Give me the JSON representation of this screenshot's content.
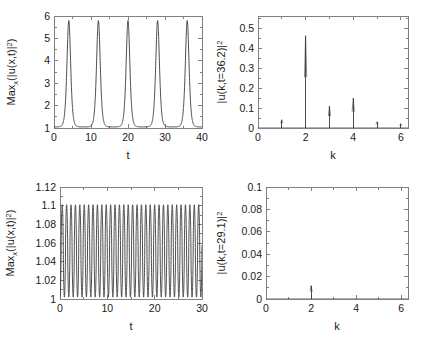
{
  "figure": {
    "background": "#ffffff",
    "curve_color": "#3a3a3a",
    "axis_color": "#808080",
    "panel_count": 4
  },
  "chart_data": [
    {
      "id": "top-left",
      "type": "line",
      "title": "",
      "xlabel": "t",
      "ylabel": "Max_x(|u(x,t)|^2)",
      "ylabel_parts": {
        "main": "Max",
        "sub": "x",
        "rest": "(|u(x,t)|",
        "sup": "2",
        "tail": ")"
      },
      "xlim": [
        0,
        40
      ],
      "ylim": [
        1,
        6
      ],
      "xticks": [
        0,
        10,
        20,
        30,
        40
      ],
      "xticklabels": [
        "0",
        "10",
        "20",
        "30",
        "40"
      ],
      "yticks": [
        1,
        2,
        3,
        4,
        5,
        6
      ],
      "yticklabels": [
        "1",
        "2",
        "3",
        "4",
        "5",
        "6"
      ],
      "xminorticks": [
        5,
        15,
        25,
        35
      ],
      "yminorticks": [
        1.5,
        2.5,
        3.5,
        4.5,
        5.5
      ],
      "grid": false,
      "legend": null,
      "series": [
        {
          "name": "max amplitude",
          "description": "periodic recurrence peaks",
          "peak_value": 5.8,
          "baseline_value": 1.05,
          "period": 8.0,
          "peak_times": [
            4.0,
            12.0,
            20.0,
            28.0,
            36.0
          ],
          "peak_width": 1.35,
          "start_value": 1.1
        }
      ]
    },
    {
      "id": "top-right",
      "type": "line",
      "title": "",
      "xlabel": "k",
      "ylabel": "|u(k,t=36.2)|^2",
      "ylabel_parts": {
        "main": "|u(k,t=36.2)|",
        "sup": "2"
      },
      "xlim": [
        0,
        6.3
      ],
      "ylim": [
        0,
        0.56
      ],
      "xticks": [
        0,
        2,
        4,
        6
      ],
      "xticklabels": [
        "0",
        "2",
        "4",
        "6"
      ],
      "yticks": [
        0,
        0.1,
        0.2,
        0.3,
        0.4,
        0.5
      ],
      "yticklabels": [
        "0",
        "0.1",
        "0.2",
        "0.3",
        "0.4",
        "0.5"
      ],
      "xminorticks": [
        1,
        3,
        5
      ],
      "yminorticks": [
        0.05,
        0.15,
        0.25,
        0.35,
        0.45,
        0.55
      ],
      "grid": false,
      "legend": null,
      "spikes": [
        {
          "k": 1,
          "value": 0.042
        },
        {
          "k": 2,
          "value": 0.462
        },
        {
          "k": 3,
          "value": 0.108
        },
        {
          "k": 4,
          "value": 0.148
        },
        {
          "k": 5,
          "value": 0.032
        },
        {
          "k": 6,
          "value": 0.022
        }
      ]
    },
    {
      "id": "bottom-left",
      "type": "line",
      "title": "",
      "xlabel": "t",
      "ylabel": "Max_x(|u(x,t)|^2)",
      "ylabel_parts": {
        "main": "Max",
        "sub": "x",
        "rest": "(|u(x,t)|",
        "sup": "2",
        "tail": ")"
      },
      "xlim": [
        0,
        30
      ],
      "ylim": [
        1,
        1.12
      ],
      "xticks": [
        0,
        10,
        20,
        30
      ],
      "xticklabels": [
        "0",
        "10",
        "20",
        "30"
      ],
      "yticks": [
        1,
        1.02,
        1.04,
        1.06,
        1.08,
        1.1,
        1.12
      ],
      "yticklabels": [
        "1",
        "1.02",
        "1.04",
        "1.06",
        "1.08",
        "1.1",
        "1.12"
      ],
      "xminorticks": [
        5,
        15,
        25
      ],
      "yminorticks": [
        1.01,
        1.03,
        1.05,
        1.07,
        1.09,
        1.11
      ],
      "grid": false,
      "legend": null,
      "series": [
        {
          "name": "max amplitude small oscillation",
          "description": "fast near-sinusoidal oscillation",
          "upper_envelope": 1.101,
          "lower_envelope": 1.002,
          "period": 0.93,
          "cycle_count": 32,
          "start_value": 1.0
        }
      ]
    },
    {
      "id": "bottom-right",
      "type": "line",
      "title": "",
      "xlabel": "k",
      "ylabel": "|u(k,t=29.1)|^2",
      "ylabel_parts": {
        "main": "|u(k,t=29.1)|",
        "sup": "2"
      },
      "xlim": [
        0,
        6.3
      ],
      "ylim": [
        0,
        0.1
      ],
      "xticks": [
        0,
        2,
        4,
        6
      ],
      "xticklabels": [
        "0",
        "2",
        "4",
        "6"
      ],
      "yticks": [
        0,
        0.02,
        0.04,
        0.06,
        0.08,
        0.1
      ],
      "yticklabels": [
        "0",
        "0.02",
        "0.04",
        "0.06",
        "0.08",
        "0.1"
      ],
      "xminorticks": [
        1,
        3,
        5
      ],
      "yminorticks": [
        0.01,
        0.03,
        0.05,
        0.07,
        0.09
      ],
      "grid": false,
      "legend": null,
      "spikes": [
        {
          "k": 2,
          "value": 0.012
        }
      ]
    }
  ]
}
